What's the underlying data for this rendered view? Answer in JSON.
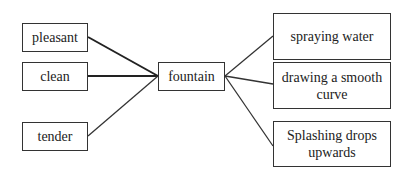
{
  "diagram": {
    "center": {
      "id": "fountain",
      "label": "fountain"
    },
    "left_nodes": [
      {
        "id": "pleasant",
        "label": "pleasant"
      },
      {
        "id": "clean",
        "label": "clean"
      },
      {
        "id": "tender",
        "label": "tender"
      }
    ],
    "right_nodes": [
      {
        "id": "spraying-water",
        "label": "spraying water"
      },
      {
        "id": "drawing-smooth-curve",
        "label": "drawing a smooth curve"
      },
      {
        "id": "splashing-drops",
        "label": "Splashing drops upwards"
      }
    ],
    "edges": [
      {
        "from": "pleasant",
        "to": "fountain"
      },
      {
        "from": "clean",
        "to": "fountain"
      },
      {
        "from": "tender",
        "to": "fountain"
      },
      {
        "from": "fountain",
        "to": "spraying-water"
      },
      {
        "from": "fountain",
        "to": "drawing-smooth-curve"
      },
      {
        "from": "fountain",
        "to": "splashing-drops"
      }
    ],
    "line_color": "#333333"
  }
}
